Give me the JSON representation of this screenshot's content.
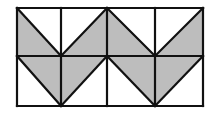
{
  "diagram": {
    "title": "Grid of shaded triangles (zigzag pattern)",
    "colors": {
      "stroke": "#111111",
      "fill": "#bdbdbd",
      "background": "#ffffff"
    },
    "grid": {
      "cols": 4,
      "rows": 2,
      "x": [
        17,
        61,
        107,
        155,
        203
      ],
      "y": [
        8,
        56,
        106
      ]
    },
    "shaded_regions": [
      {
        "points": "17,8 17,56 61,56"
      },
      {
        "points": "61,56 107,8 107,56"
      },
      {
        "points": "107,8 107,56 155,56"
      },
      {
        "points": "155,56 203,8 203,56"
      },
      {
        "points": "17,56 61,56 61,106"
      },
      {
        "points": "61,56 107,56 61,106"
      },
      {
        "points": "107,56 155,56 155,106"
      },
      {
        "points": "155,56 203,56 155,106"
      }
    ],
    "diagonals": [
      [
        17,
        8,
        61,
        56
      ],
      [
        61,
        56,
        107,
        8
      ],
      [
        107,
        8,
        155,
        56
      ],
      [
        155,
        56,
        203,
        8
      ],
      [
        17,
        56,
        61,
        106
      ],
      [
        61,
        106,
        107,
        56
      ],
      [
        107,
        56,
        155,
        106
      ],
      [
        155,
        106,
        203,
        56
      ]
    ]
  }
}
